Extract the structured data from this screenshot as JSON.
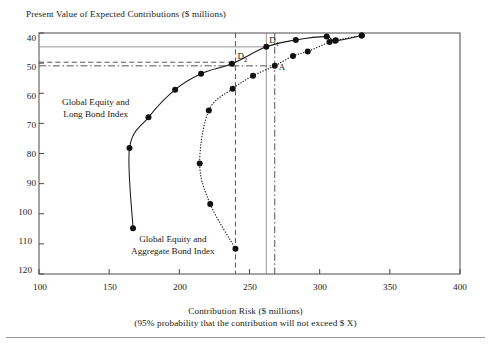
{
  "chart_data": {
    "type": "scatter",
    "title": "Present Value of Expected Contributions ($ millions)",
    "xlabel": "Contribution Risk ($ millions)",
    "xlabel_sub": "(95% probability that the contribution will not exceed $ X)",
    "ylabel": "Present Value of Expected Contributions ($ millions)",
    "xlim": [
      100,
      400
    ],
    "ylim": [
      120,
      40
    ],
    "y_inverted": true,
    "xticks": [
      100,
      150,
      200,
      250,
      300,
      350,
      400
    ],
    "yticks": [
      40,
      50,
      60,
      70,
      80,
      90,
      100,
      110,
      120
    ],
    "grid": false,
    "legend": "inline-annotations",
    "series": [
      {
        "name": "Global Equity and Long Bond Index",
        "style": "solid",
        "marker": "filled-circle",
        "points": [
          [
            167.0,
            104.8
          ],
          [
            164.5,
            78.2
          ],
          [
            178.0,
            68.0
          ],
          [
            197.0,
            58.8
          ],
          [
            215.5,
            53.5
          ],
          [
            237.5,
            50.2
          ],
          [
            262.0,
            44.6
          ],
          [
            283.0,
            42.3
          ],
          [
            305.0,
            41.2
          ],
          [
            311.0,
            42.6
          ],
          [
            330.0,
            40.8
          ]
        ]
      },
      {
        "name": "Global Equity and Aggregate Bond Index",
        "style": "dotted",
        "marker": "filled-circle",
        "points": [
          [
            240.0,
            111.6
          ],
          [
            222.0,
            96.8
          ],
          [
            214.5,
            83.3
          ],
          [
            221.0,
            65.7
          ],
          [
            238.0,
            58.5
          ],
          [
            252.5,
            54.2
          ],
          [
            268.0,
            50.9
          ],
          [
            281.0,
            47.6
          ],
          [
            291.5,
            46.1
          ],
          [
            307.0,
            43.0
          ],
          [
            311.5,
            42.4
          ],
          [
            330.0,
            40.8
          ]
        ]
      }
    ],
    "annotations": [
      {
        "id": "D1",
        "label": "D",
        "subscript": "1",
        "x": 262.0,
        "y": 44.6,
        "series": "Global Equity and Long Bond Index"
      },
      {
        "id": "D2",
        "label": "D",
        "subscript": "2",
        "x": 240.0,
        "y": 49.7,
        "series": "Global Equity and Long Bond Index"
      },
      {
        "id": "A",
        "label": "A",
        "subscript": "",
        "x": 268.0,
        "y": 50.9,
        "series": "Global Equity and Aggregate Bond Index"
      }
    ],
    "reference_lines": [
      {
        "name": "vline-D2",
        "orientation": "vertical",
        "value": 240.0,
        "style": "dashed",
        "color": "#555555"
      },
      {
        "name": "vline-D1",
        "orientation": "vertical",
        "value": 262.0,
        "style": "solid",
        "color": "#8a8a8a"
      },
      {
        "name": "vline-A",
        "orientation": "vertical",
        "value": 268.0,
        "style": "dashdot",
        "color": "#555555"
      },
      {
        "name": "hline-D1",
        "orientation": "horizontal",
        "value": 44.6,
        "style": "solid",
        "color": "#8a8a8a"
      },
      {
        "name": "hline-D2",
        "orientation": "horizontal",
        "value": 49.7,
        "style": "dashed",
        "color": "#555555"
      },
      {
        "name": "hline-A",
        "orientation": "horizontal",
        "value": 50.9,
        "style": "dashdot",
        "color": "#555555"
      }
    ],
    "series_label_positions": [
      {
        "series": "Global Equity and Long Bond Index",
        "line1": "Global Equity and",
        "line2": "Long Bond Index",
        "left_px": 62,
        "top_px": 97
      },
      {
        "series": "Global Equity and Aggregate Bond Index",
        "line1": "Global Equity and",
        "line2": "Aggregate Bond Index",
        "left_px": 131,
        "top_px": 234
      }
    ]
  },
  "colors": {
    "frame": "#4a4a4a",
    "curve": "#1a1a1a",
    "marker": "#111111",
    "refline_gray": "#8a8a8a",
    "refline_dark": "#555555",
    "text": "#1a1a1a",
    "page_rule": "#9a9a9a"
  }
}
